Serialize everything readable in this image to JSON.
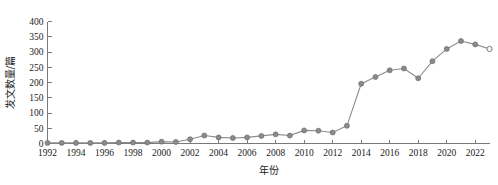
{
  "chart_data": {
    "type": "line",
    "title": "",
    "xlabel": "年份",
    "ylabel": "发文数量/篇",
    "xlim": [
      1992,
      2023
    ],
    "ylim": [
      0,
      400
    ],
    "grid": false,
    "legend": false,
    "y_ticks": [
      0,
      50,
      100,
      150,
      200,
      250,
      300,
      350,
      400
    ],
    "x_ticks": [
      1992,
      1994,
      1996,
      1998,
      2000,
      2002,
      2004,
      2006,
      2008,
      2010,
      2012,
      2014,
      2016,
      2018,
      2020,
      2022
    ],
    "marker_style": "filled-circle",
    "last_point_marker": "open-circle",
    "series": [
      {
        "name": "发文数量",
        "x": [
          1992,
          1993,
          1994,
          1995,
          1996,
          1997,
          1998,
          1999,
          2000,
          2001,
          2002,
          2003,
          2004,
          2005,
          2006,
          2007,
          2008,
          2009,
          2010,
          2011,
          2012,
          2013,
          2014,
          2015,
          2016,
          2017,
          2018,
          2019,
          2020,
          2021,
          2022,
          2023
        ],
        "values": [
          2,
          2,
          2,
          2,
          2,
          3,
          3,
          3,
          6,
          5,
          14,
          26,
          20,
          18,
          20,
          25,
          30,
          26,
          43,
          42,
          36,
          58,
          196,
          218,
          240,
          246,
          214,
          270,
          310,
          336,
          325,
          310
        ]
      }
    ],
    "colors": {
      "line": "#8c8c8c",
      "marker": "#8a8a8a",
      "axis": "#7a7a7a",
      "text": "#1a1a1a",
      "background": "#ffffff"
    }
  }
}
